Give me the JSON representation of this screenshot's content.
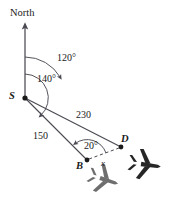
{
  "figure": {
    "title_label": "North",
    "background_color": "#ffffff",
    "line_color": "#4a4a52",
    "text_color": "#1a1a1a",
    "plane_near_b_color": "#6e6e6e",
    "plane_near_d_color": "#262626",
    "points": {
      "s": {
        "label": "S",
        "x": 25,
        "y": 98
      },
      "b": {
        "label": "B",
        "x": 87,
        "y": 160
      },
      "d": {
        "label": "D",
        "x": 121,
        "y": 147
      }
    },
    "angles": {
      "bearing_to_d": "120°",
      "bearing_to_b": "140°",
      "angle_at_b": "20°"
    },
    "distances": {
      "s_to_d": "230",
      "s_to_b": "150",
      "b_to_d": "x"
    },
    "icons": {
      "north_arrow": "north-arrow-icon",
      "plane_b": "airplane-icon",
      "plane_d": "airplane-icon"
    }
  }
}
